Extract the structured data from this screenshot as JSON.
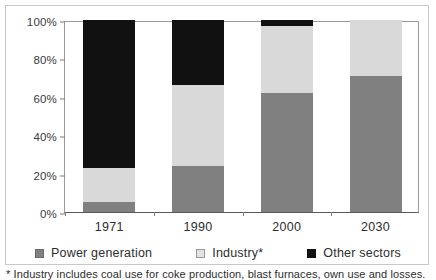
{
  "chart_data": {
    "type": "bar",
    "subtype": "stacked-percent",
    "title": "",
    "xlabel": "",
    "ylabel": "",
    "categories": [
      "1971",
      "1990",
      "2000",
      "2030"
    ],
    "series": [
      {
        "name": "Power generation",
        "color": "#808080",
        "values": [
          5,
          24,
          62,
          71
        ]
      },
      {
        "name": "Industry*",
        "color": "#d9d9d9",
        "values": [
          18,
          42,
          35,
          29
        ]
      },
      {
        "name": "Other sectors",
        "color": "#111111",
        "values": [
          77,
          34,
          3,
          0
        ]
      }
    ],
    "ylim": [
      0,
      100
    ],
    "yticks": [
      "0%",
      "20%",
      "40%",
      "60%",
      "80%",
      "100%"
    ],
    "ytick_values": [
      0,
      20,
      40,
      60,
      80,
      100
    ],
    "grid": false,
    "legend_position": "bottom"
  },
  "axis": {
    "y": {
      "ticks": [
        {
          "label": "100%",
          "value": 100
        },
        {
          "label": "80%",
          "value": 80
        },
        {
          "label": "60%",
          "value": 60
        },
        {
          "label": "40%",
          "value": 40
        },
        {
          "label": "20%",
          "value": 20
        },
        {
          "label": "0%",
          "value": 0
        }
      ]
    },
    "x": {
      "ticks": [
        {
          "label": "1971"
        },
        {
          "label": "1990"
        },
        {
          "label": "2000"
        },
        {
          "label": "2030"
        }
      ]
    }
  },
  "legend": {
    "items": [
      {
        "label": "Power generation",
        "swatch": "dark-gray-swatch"
      },
      {
        "label": "Industry*",
        "swatch": "light-gray-swatch"
      },
      {
        "label": "Other sectors",
        "swatch": "black-swatch"
      }
    ]
  },
  "footnote": {
    "text": "* Industry includes coal use for coke production, blast furnaces, own use and losses."
  }
}
